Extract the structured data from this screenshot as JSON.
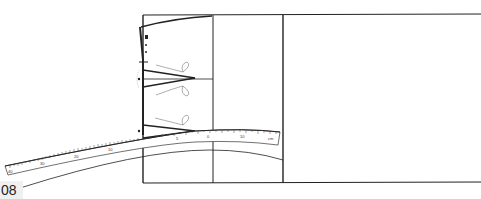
{
  "figure": {
    "page_label": "08",
    "colors": {
      "line": "#222222",
      "thin_line": "#555555",
      "background": "#ffffff",
      "label_bg": "#f0f0f0"
    },
    "ruler": {
      "labels": [
        "40",
        "30",
        "20",
        "10",
        "5",
        "0",
        "10",
        "20",
        "cm"
      ]
    }
  }
}
